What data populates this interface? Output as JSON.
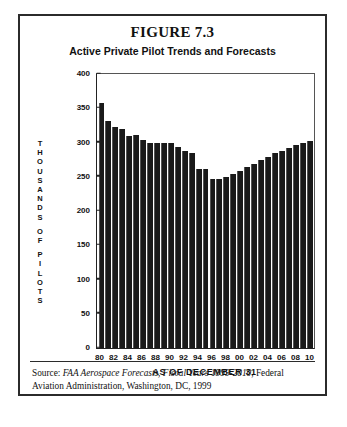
{
  "figure": {
    "title": "FIGURE 7.3",
    "subtitle": "Active Private Pilot Trends and Forecasts",
    "x_caption": "AS OF DECEMBER 31",
    "source_prefix": "Source: ",
    "source_italic": "FAA Aerospace Forecasts, Fiscal Years 1999-2010",
    "source_rest": ", Federal Aviation Administration, Washington, DC, 1999"
  },
  "chart_data": {
    "type": "bar",
    "title": "Active Private Pilot Trends and Forecasts",
    "subtitle": "FIGURE 7.3",
    "xlabel": "AS OF DECEMBER 31",
    "ylabel": "THOUSANDS OF PILOTS",
    "ylim": [
      0,
      400
    ],
    "yticks": [
      0,
      50,
      100,
      150,
      200,
      250,
      300,
      350,
      400
    ],
    "grid": false,
    "legend": null,
    "bar_color": "#1a1a1a",
    "categories": [
      "80",
      "81",
      "82",
      "83",
      "84",
      "85",
      "86",
      "87",
      "88",
      "89",
      "90",
      "91",
      "92",
      "93",
      "94",
      "95",
      "96",
      "97",
      "98",
      "99",
      "00",
      "01",
      "02",
      "03",
      "04",
      "05",
      "06",
      "07",
      "08",
      "09",
      "10"
    ],
    "xtick_labels": [
      "80",
      "82",
      "84",
      "86",
      "88",
      "90",
      "92",
      "94",
      "96",
      "98",
      "00",
      "02",
      "04",
      "06",
      "08",
      "10"
    ],
    "values": [
      357,
      331,
      322,
      320,
      310,
      311,
      303,
      299,
      300,
      300,
      299,
      293,
      288,
      284,
      261,
      261,
      247,
      247,
      250,
      254,
      258,
      264,
      269,
      274,
      279,
      284,
      288,
      292,
      296,
      299,
      302
    ]
  }
}
